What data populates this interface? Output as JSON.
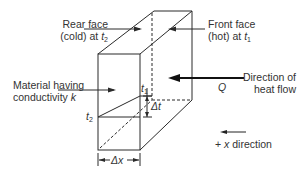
{
  "labels": {
    "rear_face_line1": "Rear face",
    "rear_face_line2": "(cold) at ",
    "rear_face_var": "t",
    "rear_face_sub": "2",
    "front_face_line1": "Front face",
    "front_face_line2": "(hot) at ",
    "front_face_var": "t",
    "front_face_sub": "1",
    "material_line1": "Material having",
    "material_line2": "conductivity ",
    "material_var": "k",
    "direction_line1": "Direction of",
    "direction_line2": "heat flow",
    "q_symbol": "Q",
    "t1_var": "t",
    "t1_sub": "1",
    "t2_var": "t",
    "t2_sub": "2",
    "delta_t": "Δt",
    "delta_x": "Δx",
    "x_direction": "+ x direction",
    "x_direction_prefix": "+ ",
    "x_direction_var": "x",
    "x_direction_suffix": " direction"
  },
  "colors": {
    "line": "#2a2a2a",
    "text": "#333333"
  }
}
